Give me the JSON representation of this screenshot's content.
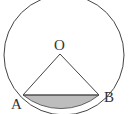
{
  "diagram": {
    "type": "circle-segment",
    "labels": {
      "center": "O",
      "point_a": "A",
      "point_b": "B"
    },
    "colors": {
      "stroke": "#444444",
      "segment_fill": "#bdbdbd",
      "background": "#ffffff"
    }
  }
}
